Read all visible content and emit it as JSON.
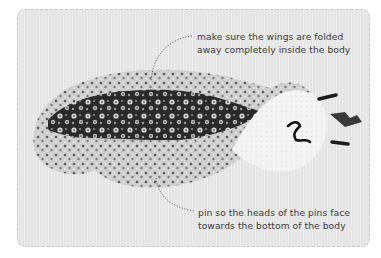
{
  "figure": {
    "type": "instructional-photo",
    "colors": {
      "panel_background": "#e9e9e9",
      "panel_border": "#c8c8c8",
      "text": "#3b3b3b",
      "fabric_dark": "#1f1f1f",
      "fabric_light": "#d0d0d0",
      "fleece": "#f4f4f4"
    }
  },
  "annotations": {
    "top": {
      "line1": "make sure the wings are folded",
      "line2": "away completely inside the body"
    },
    "bottom": {
      "line1": "pin so the heads of the pins face",
      "line2": "towards the bottom of the body"
    }
  }
}
